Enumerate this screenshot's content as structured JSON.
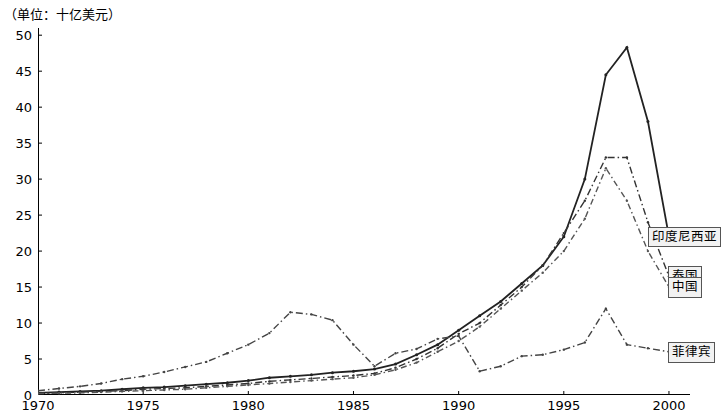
{
  "unit_note": "（单位：十亿美元）",
  "chart_data": {
    "type": "line",
    "title": "",
    "subtitle": "",
    "unit_label": "（单位：十亿美元）",
    "xlabel": "",
    "ylabel": "",
    "xlim": [
      1970,
      2001
    ],
    "ylim": [
      0,
      51
    ],
    "grid": false,
    "legend_position": "right-inline-callouts",
    "x_ticks": [
      "1970",
      "1975",
      "1980",
      "1985",
      "1990",
      "1995",
      "2000"
    ],
    "x_tick_values": [
      1970,
      1975,
      1980,
      1985,
      1990,
      1995,
      2000
    ],
    "y_ticks": [
      "0",
      "5",
      "10",
      "15",
      "20",
      "25",
      "30",
      "35",
      "40",
      "45",
      "50"
    ],
    "y_tick_values": [
      0,
      5,
      10,
      15,
      20,
      25,
      30,
      35,
      40,
      45,
      50
    ],
    "x": [
      1970,
      1971,
      1972,
      1973,
      1974,
      1975,
      1976,
      1977,
      1978,
      1979,
      1980,
      1981,
      1982,
      1983,
      1984,
      1985,
      1986,
      1987,
      1988,
      1989,
      1990,
      1991,
      1992,
      1993,
      1994,
      1995,
      1996,
      1997,
      1998,
      1999,
      2000
    ],
    "series": [
      {
        "name": "印度尼西亚",
        "label": "印度尼西亚",
        "color": "#222222",
        "style": "solid-marker",
        "values": [
          0.3,
          0.4,
          0.5,
          0.6,
          0.8,
          1.0,
          1.1,
          1.3,
          1.5,
          1.7,
          2.0,
          2.4,
          2.6,
          2.8,
          3.1,
          3.3,
          3.6,
          4.3,
          5.6,
          7.0,
          9.0,
          11.0,
          13.0,
          15.5,
          18.0,
          22.0,
          30.0,
          44.5,
          48.3,
          38.0,
          22.0
        ]
      },
      {
        "name": "泰国",
        "label": "泰国",
        "color": "#333333",
        "style": "dash-dot",
        "values": [
          0.2,
          0.3,
          0.4,
          0.5,
          0.6,
          0.8,
          0.9,
          1.0,
          1.2,
          1.4,
          1.6,
          1.9,
          2.1,
          2.3,
          2.5,
          2.7,
          3.0,
          3.8,
          5.0,
          6.5,
          8.5,
          10.0,
          12.5,
          15.0,
          18.0,
          22.5,
          27.0,
          33.0,
          33.0,
          24.0,
          16.5
        ]
      },
      {
        "name": "中国",
        "label": "中国",
        "color": "#555555",
        "style": "dash-dot-light",
        "values": [
          0.2,
          0.25,
          0.3,
          0.4,
          0.5,
          0.6,
          0.7,
          0.8,
          1.0,
          1.2,
          1.4,
          1.6,
          1.8,
          2.0,
          2.2,
          2.4,
          2.8,
          3.5,
          4.5,
          6.0,
          7.5,
          9.5,
          12.0,
          14.5,
          17.0,
          20.0,
          24.5,
          31.5,
          27.0,
          20.0,
          15.0
        ]
      },
      {
        "name": "菲律宾",
        "label": "菲律宾",
        "color": "#444444",
        "style": "dash-dot-marker",
        "values": [
          0.6,
          0.9,
          1.2,
          1.6,
          2.2,
          2.6,
          3.2,
          3.9,
          4.6,
          5.8,
          7.0,
          8.6,
          11.5,
          11.2,
          10.4,
          7.0,
          4.0,
          5.8,
          6.4,
          7.8,
          8.2,
          3.3,
          4.0,
          5.4,
          5.6,
          6.3,
          7.3,
          12.0,
          7.0,
          6.5,
          6.0
        ]
      }
    ],
    "callouts": [
      {
        "label": "印度尼西亚",
        "value_at_2000": 22.0
      },
      {
        "label": "泰国",
        "value_at_2000": 16.5
      },
      {
        "label": "中国",
        "value_at_2000": 15.0
      },
      {
        "label": "菲律宾",
        "value_at_2000": 6.0
      }
    ]
  }
}
